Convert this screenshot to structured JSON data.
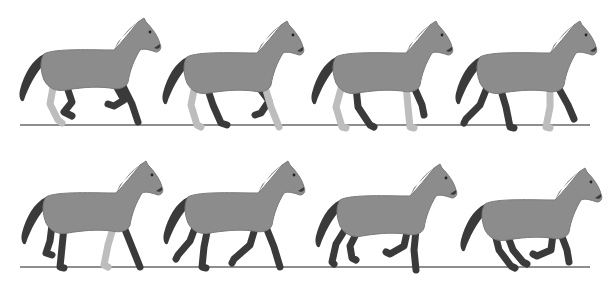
{
  "figure": {
    "rows": 2,
    "frames_per_row": 4,
    "colors": {
      "background": "#ffffff",
      "body": "#8c8c8c",
      "body_shade": "#7a7a7a",
      "dark_points": "#3a3a3a",
      "light_leg": "#bdbdbd",
      "ground_line": "#8e8e8e"
    },
    "row_1": {
      "ground": {
        "x1": 20,
        "x2": 590,
        "y": 125
      },
      "frames": [
        {
          "index": 1,
          "x": 14,
          "y": 12,
          "pose": "canter-A"
        },
        {
          "index": 2,
          "x": 157,
          "y": 15,
          "pose": "canter-B"
        },
        {
          "index": 3,
          "x": 306,
          "y": 15,
          "pose": "walk-A"
        },
        {
          "index": 4,
          "x": 450,
          "y": 15,
          "pose": "walk-B"
        }
      ]
    },
    "row_2": {
      "ground": {
        "x1": 20,
        "x2": 590,
        "y": 267
      },
      "frames": [
        {
          "index": 5,
          "x": 16,
          "y": 155,
          "pose": "walk-C"
        },
        {
          "index": 6,
          "x": 158,
          "y": 155,
          "pose": "trot-A"
        },
        {
          "index": 7,
          "x": 310,
          "y": 158,
          "pose": "gallop-A"
        },
        {
          "index": 8,
          "x": 455,
          "y": 162,
          "pose": "gallop-B"
        }
      ]
    }
  }
}
